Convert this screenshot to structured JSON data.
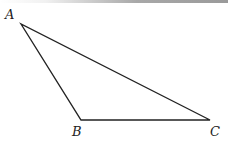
{
  "figure": {
    "type": "triangle",
    "stroke_color": "#222222",
    "stroke_width": 1.4,
    "vertices": [
      {
        "name": "A",
        "x": 21,
        "y": 24,
        "label": "A",
        "label_x": 5,
        "label_y": 8
      },
      {
        "name": "B",
        "x": 81,
        "y": 120,
        "label": "B",
        "label_x": 72,
        "label_y": 125
      },
      {
        "name": "C",
        "x": 210,
        "y": 120,
        "label": "C",
        "label_x": 210,
        "label_y": 125
      }
    ],
    "edges": [
      [
        "A",
        "B"
      ],
      [
        "B",
        "C"
      ],
      [
        "C",
        "A"
      ]
    ]
  }
}
